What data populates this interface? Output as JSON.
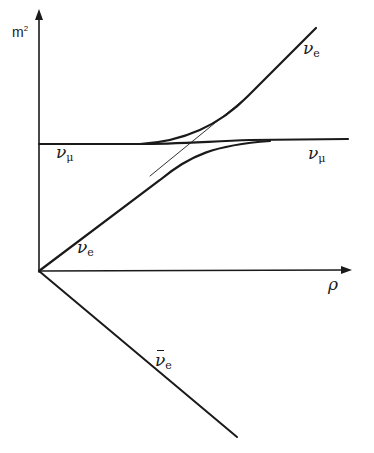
{
  "diagram": {
    "type": "energy-level-crossing",
    "axes": {
      "y_label_base": "m",
      "y_label_exp": "2",
      "x_label": "ρ"
    },
    "curves": [
      {
        "name": "nu_e",
        "symbol": "ν",
        "sub": "e",
        "description": "rises linearly from origin"
      },
      {
        "name": "nu_mu",
        "symbol": "ν",
        "sub": "μ",
        "description": "horizontal constant level"
      },
      {
        "name": "anti_nu_e",
        "symbol": "ν",
        "sub": "e",
        "bar": true,
        "description": "descends linearly from origin"
      }
    ],
    "labels": {
      "nu_e_top": {
        "symbol": "ν",
        "sub": "e"
      },
      "nu_e_bottom": {
        "symbol": "ν",
        "sub": "e"
      },
      "nu_mu_left": {
        "symbol": "ν",
        "sub": "μ"
      },
      "nu_mu_right": {
        "symbol": "ν",
        "sub": "μ"
      },
      "anti_nu_e": {
        "symbol": "ν",
        "sub": "e"
      }
    },
    "colors": {
      "ink": "#1a1a1a",
      "background": "#ffffff"
    }
  }
}
